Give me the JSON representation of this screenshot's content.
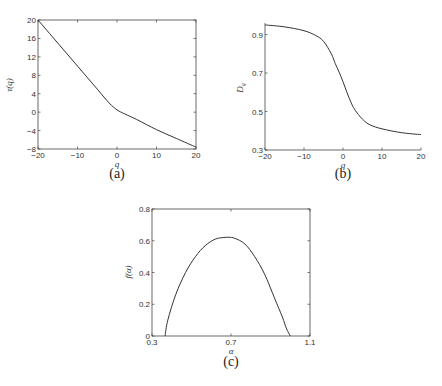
{
  "chart_data": [
    {
      "id": "a",
      "type": "line",
      "caption": "(a)",
      "title": "",
      "xlabel": "q",
      "ylabel": "τ(q)",
      "xlim": [
        -20,
        20
      ],
      "ylim": [
        -8,
        20
      ],
      "xticks": [
        -20,
        -10,
        0,
        10,
        20
      ],
      "yticks": [
        20,
        16,
        12,
        8,
        4,
        0,
        -4,
        -8
      ],
      "grid": false,
      "series": [
        {
          "name": "tau",
          "x": [
            -20,
            -15,
            -10,
            -5,
            -2,
            0,
            2,
            5,
            10,
            15,
            20
          ],
          "y": [
            20,
            15,
            10,
            5,
            2,
            0.5,
            -0.4,
            -1.6,
            -3.8,
            -5.7,
            -7.6
          ]
        }
      ]
    },
    {
      "id": "b",
      "type": "line",
      "caption": "(b)",
      "title": "",
      "xlabel": "q",
      "ylabel": "D_q",
      "xlim": [
        -20,
        20
      ],
      "ylim": [
        0.3,
        0.96
      ],
      "xticks": [
        -20,
        -10,
        0,
        10,
        20
      ],
      "yticks": [
        0.9,
        0.7,
        0.5,
        0.3
      ],
      "grid": false,
      "series": [
        {
          "name": "Dq",
          "x": [
            -20,
            -15,
            -10,
            -7,
            -5,
            -3,
            -2,
            -1,
            0,
            1,
            2,
            3,
            5,
            7,
            10,
            15,
            20
          ],
          "y": [
            0.95,
            0.94,
            0.92,
            0.895,
            0.865,
            0.8,
            0.75,
            0.705,
            0.655,
            0.6,
            0.55,
            0.51,
            0.46,
            0.43,
            0.41,
            0.39,
            0.38
          ]
        }
      ]
    },
    {
      "id": "c",
      "type": "line",
      "caption": "(c)",
      "title": "",
      "xlabel": "α",
      "ylabel": "f(α)",
      "xlim": [
        0.3,
        1.1
      ],
      "ylim": [
        0,
        0.8
      ],
      "xticks": [
        0.3,
        0.7,
        1.1
      ],
      "yticks": [
        0.8,
        0.6,
        0.4,
        0.2,
        0
      ],
      "grid": false,
      "series": [
        {
          "name": "f_alpha",
          "x": [
            0.366,
            0.38,
            0.42,
            0.47,
            0.52,
            0.57,
            0.62,
            0.66,
            0.69,
            0.72,
            0.77,
            0.82,
            0.87,
            0.92,
            0.96,
            0.98,
            1.0
          ],
          "y": [
            0,
            0.1,
            0.26,
            0.4,
            0.5,
            0.57,
            0.61,
            0.62,
            0.622,
            0.615,
            0.58,
            0.5,
            0.39,
            0.24,
            0.12,
            0.05,
            0
          ]
        }
      ]
    }
  ]
}
